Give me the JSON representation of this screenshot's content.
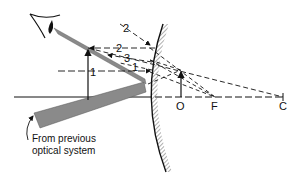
{
  "diagram": {
    "points": {
      "object": "O",
      "focus": "F",
      "center": "C"
    },
    "ray_labels": {
      "ray2_incoming": "2",
      "ray2_reflected": "2",
      "ray3": "3",
      "ray1_right": "1",
      "ray1_left": "1"
    },
    "caption_line1": "From previous",
    "caption_line2": "optical system",
    "colors": {
      "line": "#111111",
      "beam": "#888888",
      "background": "#ffffff"
    }
  }
}
